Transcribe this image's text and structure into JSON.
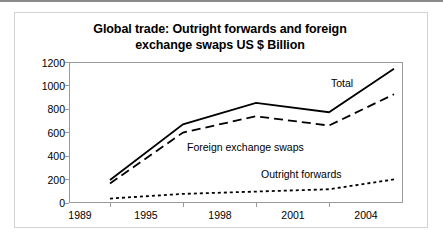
{
  "chart_data": {
    "type": "line",
    "title": "Global trade: Outright forwards and foreign exchange swaps US $ Billion",
    "title_line1": "Global trade: Outright forwards and foreign",
    "title_line2": "exchange swaps US $ Billion",
    "xlabel": "",
    "ylabel": "",
    "categories": [
      "1989",
      "1995",
      "1998",
      "2001",
      "2004"
    ],
    "ylim": [
      0,
      1200
    ],
    "yticks": [
      "0",
      "200",
      "400",
      "600",
      "800",
      "1000",
      "1200"
    ],
    "ytick_values": [
      0,
      200,
      400,
      600,
      800,
      1000,
      1200
    ],
    "grid": false,
    "legend_position": "inline-annotations",
    "series": [
      {
        "name": "Total",
        "style": "solid",
        "color": "#000000",
        "values": [
          190,
          670,
          855,
          775,
          1150
        ]
      },
      {
        "name": "Foreign exchange swaps",
        "style": "dashed",
        "color": "#000000",
        "values": [
          160,
          600,
          740,
          660,
          930
        ]
      },
      {
        "name": "Outright forwards",
        "style": "dotted",
        "color": "#000000",
        "values": [
          30,
          70,
          90,
          110,
          195
        ]
      }
    ],
    "annotations": [
      {
        "text": "Total",
        "series": "Total"
      },
      {
        "text": "Foreign exchange swaps",
        "series": "Foreign exchange swaps"
      },
      {
        "text": "Outright forwards",
        "series": "Outright forwards"
      }
    ]
  }
}
